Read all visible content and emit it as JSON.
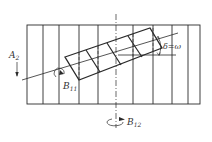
{
  "diagram": {
    "type": "engineering-sketch",
    "stroke_color": "#2a2a2a",
    "labels": {
      "a2_main": "A",
      "a2_sub": "2",
      "b11_main": "B",
      "b11_sub": "11",
      "b12_main": "B",
      "b12_sub": "12",
      "delta_omega": "δ=ω"
    },
    "frame": {
      "x1": 27,
      "y1": 25,
      "x2": 200,
      "y2": 104
    },
    "verticals": [
      43,
      59,
      79,
      98,
      133,
      153,
      172,
      188
    ],
    "axis_x": 116,
    "parallelogram": [
      [
        65,
        57
      ],
      [
        150,
        28
      ],
      [
        162,
        48
      ],
      [
        79,
        80
      ]
    ]
  }
}
